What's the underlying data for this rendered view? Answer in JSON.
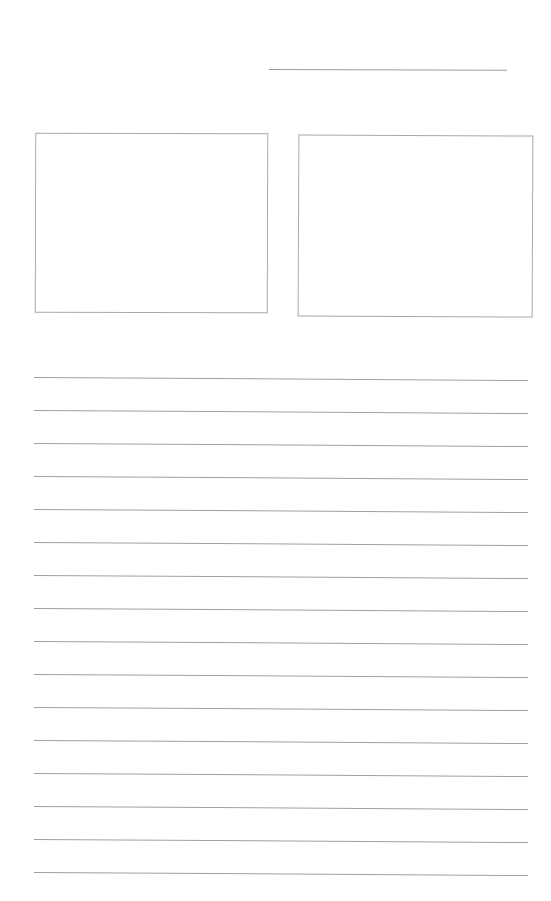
{
  "page": {
    "type": "blank worksheet",
    "background": "#ffffff",
    "line_color": "#a0a0a0"
  },
  "header": {
    "name_line": {
      "label": ""
    }
  },
  "boxes": [
    {
      "id": "left",
      "content": ""
    },
    {
      "id": "right",
      "content": ""
    }
  ],
  "ruled_lines": {
    "count": 16,
    "tops": [
      377,
      410,
      443,
      476,
      509,
      542,
      575,
      608,
      641,
      674,
      707,
      740,
      773,
      806,
      839,
      872
    ]
  }
}
